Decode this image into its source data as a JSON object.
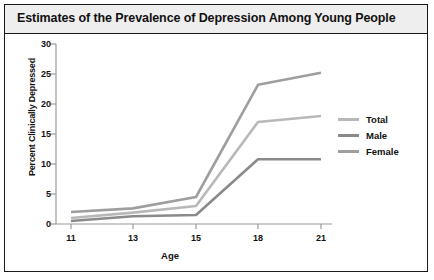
{
  "figure": {
    "title": "Estimates of the Prevalence of Depression Among Young People",
    "background_color": "#ffffff",
    "border_color": "#1a1a1a",
    "title_band_color": "#eeeeee"
  },
  "legend": {
    "position": "right",
    "entries": [
      {
        "label": "Total",
        "color": "#b8b8b8"
      },
      {
        "label": "Male",
        "color": "#8a8a8a"
      },
      {
        "label": "Female",
        "color": "#9e9e9e"
      }
    ]
  },
  "axes": {
    "xlabel": "Age",
    "ylabel": "Percent Clinically Depressed",
    "xticks": [
      "11",
      "13",
      "15",
      "18",
      "21"
    ],
    "yticks": [
      "0",
      "5",
      "10",
      "15",
      "20",
      "25",
      "30"
    ]
  },
  "chart_data": {
    "type": "line",
    "title": "Estimates of the Prevalence of Depression Among Young People",
    "xlabel": "Age",
    "ylabel": "Percent Clinically Depressed",
    "categories": [
      "11",
      "13",
      "15",
      "18",
      "21"
    ],
    "x": [
      11,
      13,
      15,
      18,
      21
    ],
    "xlim": [
      11,
      21
    ],
    "ylim": [
      0,
      30
    ],
    "grid": false,
    "legend_position": "right",
    "series": [
      {
        "name": "Total",
        "color": "#b8b8b8",
        "values": [
          1.0,
          1.9,
          3.0,
          17.0,
          18.0
        ]
      },
      {
        "name": "Male",
        "color": "#8a8a8a",
        "values": [
          0.5,
          1.3,
          1.5,
          10.8,
          10.8
        ]
      },
      {
        "name": "Female",
        "color": "#9e9e9e",
        "values": [
          2.0,
          2.6,
          4.5,
          23.2,
          25.2
        ]
      }
    ]
  }
}
